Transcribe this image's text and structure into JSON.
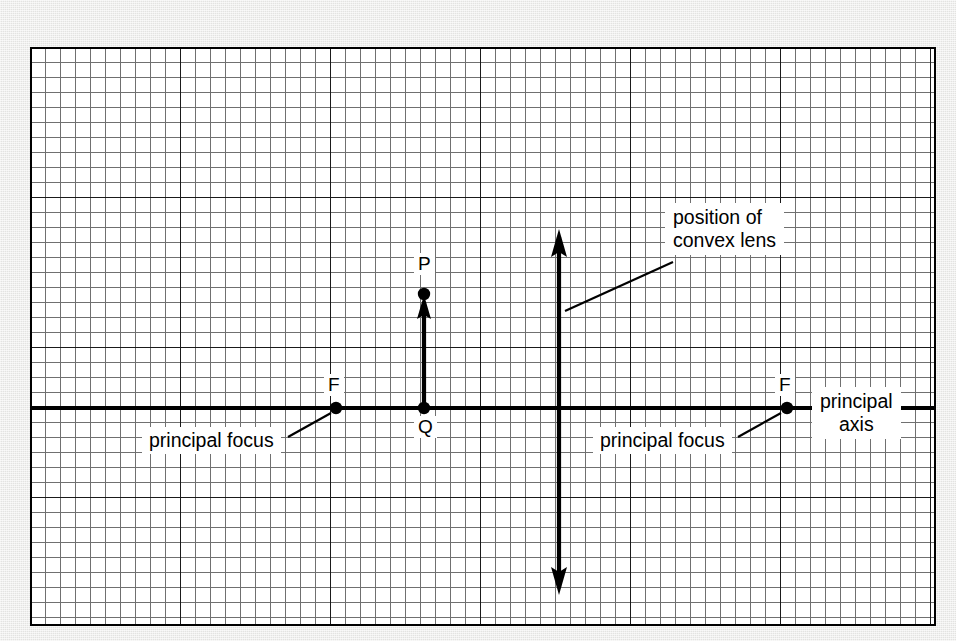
{
  "diagram": {
    "background_color": "#e9e9e7",
    "paper_color": "#ffffff",
    "ink_color": "#000000",
    "grid": {
      "minor_color": "#6b6b6b",
      "major_color": "#111111",
      "minor_spacing_px": 15,
      "major_every": 10,
      "columns_minor": 60,
      "rows_minor": 38
    }
  },
  "labels": {
    "point_p": "P",
    "point_q": "Q",
    "focus_left": "F",
    "focus_right": "F",
    "principal_focus_left": "principal focus",
    "principal_focus_right": "principal focus",
    "principal_axis_line1": "principal",
    "principal_axis_line2": "axis",
    "lens_line1": "position of",
    "lens_line2": "convex lens"
  },
  "geometry": {
    "principal_axis_y": 361,
    "lens_x": 529,
    "object_x": 394,
    "object_top_y": 247,
    "focus_left_x": 306,
    "focus_right_x": 757,
    "lens_top_y": 185,
    "lens_bottom_y": 545
  },
  "elements": {
    "object_arrow": "object PQ drawn as upward arrow from principal axis",
    "lens_arrow": "double-headed vertical arrow marking lens plane",
    "axis_line": "horizontal principal axis spanning full width"
  }
}
